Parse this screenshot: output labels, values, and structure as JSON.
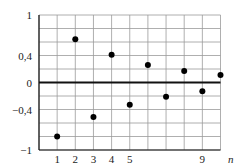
{
  "chart_data": {
    "type": "scatter",
    "title": "",
    "xlabel": "n",
    "ylabel": "",
    "x": [
      1,
      2,
      3,
      4,
      5,
      6,
      7,
      8,
      9,
      10
    ],
    "values": [
      -0.8,
      0.64,
      -0.51,
      0.41,
      -0.33,
      0.26,
      -0.21,
      0.17,
      -0.13,
      0.11
    ],
    "xlim": [
      0,
      10
    ],
    "ylim": [
      -1,
      1
    ],
    "x_tick_labels": [
      {
        "value": 1,
        "label": "1"
      },
      {
        "value": 2,
        "label": "2"
      },
      {
        "value": 3,
        "label": "3"
      },
      {
        "value": 4,
        "label": "4"
      },
      {
        "value": 5,
        "label": "5"
      },
      {
        "value": 9,
        "label": "9"
      }
    ],
    "y_tick_labels": [
      {
        "value": 1,
        "label": "1"
      },
      {
        "value": 0.4,
        "label": "0,4"
      },
      {
        "value": 0,
        "label": "0"
      },
      {
        "value": -0.4,
        "label": "−0,4"
      },
      {
        "value": -1,
        "label": "−1"
      }
    ],
    "grid": true,
    "grid_step_x": 1,
    "grid_step_y": 0.2,
    "legend": null,
    "colors": {
      "grid": "#9a9a9a",
      "axis": "#111111",
      "point": "#000000"
    }
  }
}
